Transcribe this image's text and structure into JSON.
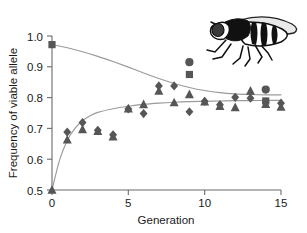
{
  "chart_data": {
    "type": "scatter",
    "title": "",
    "xlabel": "Generation",
    "ylabel": "Frequency of viable allele",
    "xlim": [
      0,
      15
    ],
    "ylim": [
      0.5,
      1.0
    ],
    "xticks": [
      0,
      5,
      10,
      15
    ],
    "yticks": [
      0.5,
      0.6,
      0.7,
      0.8,
      0.9,
      1.0
    ],
    "xtick_labels": [
      "0",
      "5",
      "10",
      "15"
    ],
    "ytick_labels": [
      "0.5",
      "0.6",
      "0.7",
      "0.8",
      "0.9",
      "1.0"
    ],
    "grid": false,
    "legend": "none",
    "series": [
      {
        "name": "High-start population (squares)",
        "marker": "square",
        "color": "#565656",
        "points": [
          {
            "x": 0,
            "y": 0.972
          },
          {
            "x": 9,
            "y": 0.875
          },
          {
            "x": 14,
            "y": 0.789
          }
        ]
      },
      {
        "name": "High-start population (circles)",
        "marker": "circle",
        "color": "#565656",
        "points": [
          {
            "x": 9,
            "y": 0.915
          },
          {
            "x": 14,
            "y": 0.826
          }
        ]
      },
      {
        "name": "Low-start population (diamonds)",
        "marker": "diamond",
        "color": "#565656",
        "points": [
          {
            "x": 1,
            "y": 0.688
          },
          {
            "x": 2,
            "y": 0.719
          },
          {
            "x": 3,
            "y": 0.694
          },
          {
            "x": 4,
            "y": 0.679
          },
          {
            "x": 5,
            "y": 0.763
          },
          {
            "x": 6,
            "y": 0.748
          },
          {
            "x": 7,
            "y": 0.838
          },
          {
            "x": 8,
            "y": 0.838
          },
          {
            "x": 9,
            "y": 0.754
          },
          {
            "x": 10,
            "y": 0.788
          },
          {
            "x": 11,
            "y": 0.777
          },
          {
            "x": 12,
            "y": 0.801
          },
          {
            "x": 13,
            "y": 0.798
          },
          {
            "x": 14,
            "y": 0.786
          },
          {
            "x": 15,
            "y": 0.782
          }
        ]
      },
      {
        "name": "Low-start population (triangles)",
        "marker": "triangle",
        "color": "#565656",
        "points": [
          {
            "x": 0,
            "y": 0.5
          },
          {
            "x": 1,
            "y": 0.663
          },
          {
            "x": 2,
            "y": 0.697
          },
          {
            "x": 3,
            "y": 0.691
          },
          {
            "x": 4,
            "y": 0.673
          },
          {
            "x": 5,
            "y": 0.764
          },
          {
            "x": 6,
            "y": 0.778
          },
          {
            "x": 7,
            "y": 0.822
          },
          {
            "x": 8,
            "y": 0.784
          },
          {
            "x": 9,
            "y": 0.81
          },
          {
            "x": 10,
            "y": 0.787
          },
          {
            "x": 11,
            "y": 0.772
          },
          {
            "x": 12,
            "y": 0.768
          },
          {
            "x": 13,
            "y": 0.822
          },
          {
            "x": 14,
            "y": 0.779
          },
          {
            "x": 15,
            "y": 0.77
          }
        ]
      }
    ],
    "fitted_curves": [
      {
        "name": "declining-fit",
        "description": "Fitted decay curve from high starting frequency",
        "color": "#9a9a9a",
        "points": [
          {
            "x": 0,
            "y": 0.972
          },
          {
            "x": 1,
            "y": 0.962
          },
          {
            "x": 2,
            "y": 0.949
          },
          {
            "x": 3,
            "y": 0.934
          },
          {
            "x": 4,
            "y": 0.917
          },
          {
            "x": 5,
            "y": 0.899
          },
          {
            "x": 6,
            "y": 0.88
          },
          {
            "x": 7,
            "y": 0.862
          },
          {
            "x": 8,
            "y": 0.846
          },
          {
            "x": 9,
            "y": 0.833
          },
          {
            "x": 10,
            "y": 0.823
          },
          {
            "x": 11,
            "y": 0.816
          },
          {
            "x": 12,
            "y": 0.812
          },
          {
            "x": 13,
            "y": 0.81
          },
          {
            "x": 14,
            "y": 0.809
          },
          {
            "x": 15,
            "y": 0.809
          }
        ]
      },
      {
        "name": "rising-fit",
        "description": "Fitted rise curve from 0.5 starting frequency",
        "color": "#9a9a9a",
        "points": [
          {
            "x": 0,
            "y": 0.5
          },
          {
            "x": 0.5,
            "y": 0.598
          },
          {
            "x": 1,
            "y": 0.661
          },
          {
            "x": 1.5,
            "y": 0.7
          },
          {
            "x": 2,
            "y": 0.725
          },
          {
            "x": 2.5,
            "y": 0.741
          },
          {
            "x": 3,
            "y": 0.752
          },
          {
            "x": 4,
            "y": 0.764
          },
          {
            "x": 5,
            "y": 0.772
          },
          {
            "x": 6,
            "y": 0.778
          },
          {
            "x": 7,
            "y": 0.782
          },
          {
            "x": 8,
            "y": 0.785
          },
          {
            "x": 9,
            "y": 0.787
          },
          {
            "x": 10,
            "y": 0.788
          },
          {
            "x": 11,
            "y": 0.789
          },
          {
            "x": 12,
            "y": 0.79
          },
          {
            "x": 13,
            "y": 0.79
          },
          {
            "x": 14,
            "y": 0.791
          },
          {
            "x": 15,
            "y": 0.791
          }
        ]
      }
    ]
  },
  "figure": {
    "illustration_label": "fruit fly"
  }
}
